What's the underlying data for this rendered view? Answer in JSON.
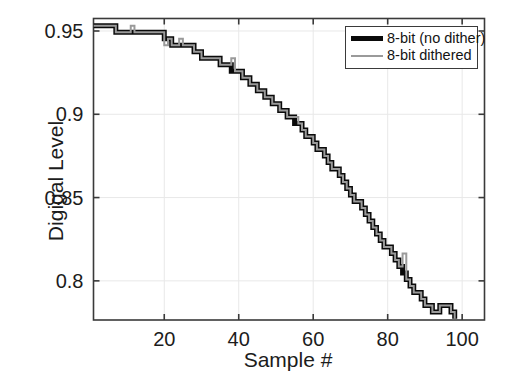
{
  "chart_data": {
    "type": "line",
    "title": "",
    "xlabel": "Sample #",
    "ylabel": "Digigal Level",
    "xlim": [
      1,
      106
    ],
    "ylim": [
      0.7765,
      0.9575
    ],
    "xticks": [
      20,
      40,
      60,
      80,
      100
    ],
    "xticklabels": [
      "20",
      "40",
      "60",
      "80",
      "100"
    ],
    "yticks": [
      0.8,
      0.85,
      0.9,
      0.95
    ],
    "yticklabels": [
      "0.8",
      "0.85",
      "0.9",
      "0.95"
    ],
    "grid": true,
    "legend_position": "upper right",
    "series": [
      {
        "name": "8-bit (no dither)",
        "color": "#0a0a0a",
        "linewidth": 5,
        "x": [
          1,
          2,
          3,
          4,
          5,
          6,
          7,
          8,
          9,
          10,
          11,
          12,
          13,
          14,
          15,
          16,
          17,
          18,
          19,
          20,
          21,
          22,
          23,
          24,
          25,
          26,
          27,
          28,
          29,
          30,
          31,
          32,
          33,
          34,
          35,
          36,
          37,
          38,
          39,
          40,
          41,
          42,
          43,
          44,
          45,
          46,
          47,
          48,
          49,
          50,
          51,
          52,
          53,
          54,
          55,
          56,
          57,
          58,
          59,
          60,
          61,
          62,
          63,
          64,
          65,
          66,
          67,
          68,
          69,
          70,
          71,
          72,
          73,
          74,
          75,
          76,
          77,
          78,
          79,
          80,
          81,
          82,
          83,
          84,
          85,
          86,
          87,
          88,
          89,
          90,
          91,
          92,
          93,
          94,
          95,
          96,
          97,
          98
        ],
        "values": [
          0.9531,
          0.9531,
          0.9531,
          0.9531,
          0.9531,
          0.9531,
          0.9492,
          0.9492,
          0.9492,
          0.9492,
          0.9492,
          0.9492,
          0.9492,
          0.9492,
          0.9492,
          0.9492,
          0.9492,
          0.9492,
          0.9492,
          0.9453,
          0.9453,
          0.9414,
          0.9414,
          0.9414,
          0.9414,
          0.9414,
          0.9414,
          0.9375,
          0.9375,
          0.9336,
          0.9336,
          0.9336,
          0.9336,
          0.9336,
          0.9297,
          0.9297,
          0.9297,
          0.9258,
          0.9258,
          0.9258,
          0.9219,
          0.9219,
          0.918,
          0.918,
          0.9141,
          0.9141,
          0.9102,
          0.9102,
          0.9063,
          0.9063,
          0.9023,
          0.9023,
          0.8984,
          0.8984,
          0.8945,
          0.8945,
          0.8906,
          0.8867,
          0.8867,
          0.8828,
          0.8789,
          0.8789,
          0.875,
          0.8711,
          0.8672,
          0.8672,
          0.8633,
          0.8594,
          0.8555,
          0.8516,
          0.8477,
          0.8477,
          0.8438,
          0.8398,
          0.8359,
          0.832,
          0.8281,
          0.8242,
          0.8203,
          0.8203,
          0.8164,
          0.8125,
          0.8086,
          0.8047,
          0.8008,
          0.7969,
          0.793,
          0.793,
          0.7891,
          0.7852,
          0.7852,
          0.7813,
          0.7813,
          0.7852,
          0.7852,
          0.7852,
          0.7813,
          0.7773
        ]
      },
      {
        "name": "8-bit dithered",
        "color": "#9a9a9a",
        "linewidth": 2,
        "x": [
          1,
          2,
          3,
          4,
          5,
          6,
          7,
          8,
          9,
          10,
          11,
          12,
          13,
          14,
          15,
          16,
          17,
          18,
          19,
          20,
          21,
          22,
          23,
          24,
          25,
          26,
          27,
          28,
          29,
          30,
          31,
          32,
          33,
          34,
          35,
          36,
          37,
          38,
          39,
          40,
          41,
          42,
          43,
          44,
          45,
          46,
          47,
          48,
          49,
          50,
          51,
          52,
          53,
          54,
          55,
          56,
          57,
          58,
          59,
          60,
          61,
          62,
          63,
          64,
          65,
          66,
          67,
          68,
          69,
          70,
          71,
          72,
          73,
          74,
          75,
          76,
          77,
          78,
          79,
          80,
          81,
          82,
          83,
          84,
          85,
          86,
          87,
          88,
          89,
          90,
          91,
          92,
          93,
          94,
          95,
          96,
          97,
          98
        ],
        "values": [
          0.9531,
          0.9531,
          0.9531,
          0.9531,
          0.9531,
          0.9531,
          0.9492,
          0.9492,
          0.9492,
          0.9492,
          0.9531,
          0.9492,
          0.9492,
          0.9492,
          0.9492,
          0.9492,
          0.9492,
          0.9492,
          0.9492,
          0.9414,
          0.9453,
          0.9414,
          0.9414,
          0.9453,
          0.9414,
          0.9414,
          0.9414,
          0.9375,
          0.9375,
          0.9336,
          0.9336,
          0.9336,
          0.9336,
          0.9336,
          0.9297,
          0.9297,
          0.9297,
          0.9336,
          0.9258,
          0.9258,
          0.9219,
          0.9219,
          0.918,
          0.918,
          0.9141,
          0.9141,
          0.9102,
          0.9102,
          0.9063,
          0.9063,
          0.9023,
          0.9023,
          0.8984,
          0.8984,
          0.8984,
          0.8945,
          0.8906,
          0.8867,
          0.8867,
          0.8828,
          0.8789,
          0.8789,
          0.875,
          0.8711,
          0.8672,
          0.8672,
          0.8633,
          0.8594,
          0.8555,
          0.8516,
          0.8477,
          0.8477,
          0.8438,
          0.8398,
          0.8359,
          0.832,
          0.8281,
          0.8242,
          0.8203,
          0.8203,
          0.8164,
          0.8125,
          0.8086,
          0.8164,
          0.8008,
          0.7969,
          0.793,
          0.793,
          0.7891,
          0.7852,
          0.7852,
          0.7813,
          0.7813,
          0.7852,
          0.7852,
          0.7852,
          0.7813,
          0.7773
        ]
      }
    ]
  },
  "axes": {
    "ylabel": "Digigal Level",
    "xlabel": "Sample #"
  },
  "legend": {
    "entries": [
      {
        "label": "8-bit (no dither)",
        "color": "#0a0a0a"
      },
      {
        "label": "8-bit dithered",
        "color": "#9a9a9a"
      }
    ]
  },
  "style": {
    "axis_color": "#3a3a3a",
    "grid_color": "#e8e8e8",
    "background": "#ffffff",
    "no_dither_color": "#0a0a0a",
    "dithered_color": "#9a9a9a"
  }
}
